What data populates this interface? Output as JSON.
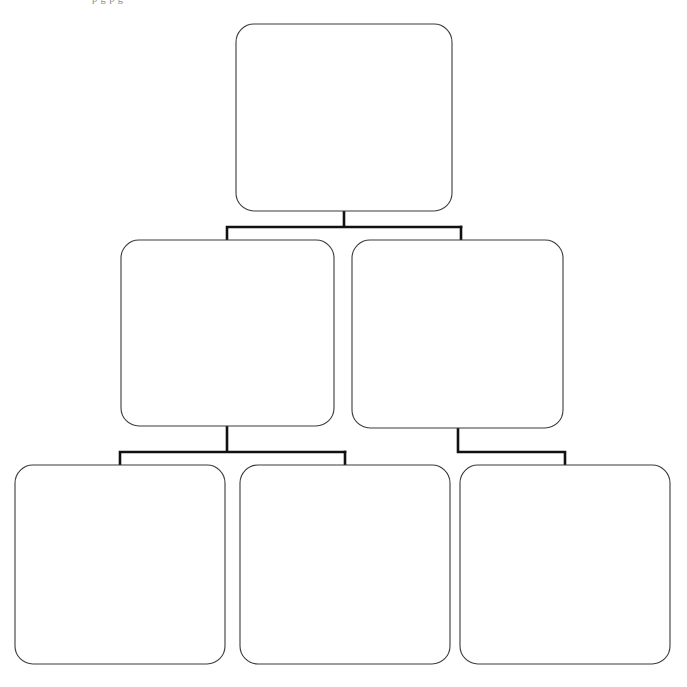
{
  "page": {
    "background_color": "#ffffff",
    "width": 687,
    "height": 687,
    "top_caption": "p g p g"
  },
  "style": {
    "node_fill": "#ffffff",
    "node_stroke": "#3b3b3b",
    "node_stroke_width": 1.1,
    "node_corner_radius": 18,
    "connector_stroke": "#111111",
    "connector_stroke_width": 2.6
  },
  "diagram": {
    "type": "hierarchy-tree",
    "orientation": "top-down",
    "levels": 3,
    "node_count": 6,
    "nodes": [
      {
        "id": "node-root",
        "level": 0,
        "label": "",
        "x": 236,
        "y": 24,
        "width": 216,
        "height": 187
      },
      {
        "id": "node-mid-left",
        "level": 1,
        "label": "",
        "x": 121,
        "y": 240,
        "width": 213,
        "height": 186
      },
      {
        "id": "node-mid-right",
        "level": 1,
        "label": "",
        "x": 352,
        "y": 240,
        "width": 211,
        "height": 188
      },
      {
        "id": "node-leaf-1",
        "level": 2,
        "label": "",
        "x": 15,
        "y": 465,
        "width": 210,
        "height": 199
      },
      {
        "id": "node-leaf-2",
        "level": 2,
        "label": "",
        "x": 240,
        "y": 465,
        "width": 210,
        "height": 199
      },
      {
        "id": "node-leaf-3",
        "level": 2,
        "label": "",
        "x": 460,
        "y": 465,
        "width": 210,
        "height": 199
      }
    ],
    "edges": [
      {
        "id": "edge-root-to-mid-left",
        "from": "node-root",
        "to": "node-mid-left",
        "path": "M344,211 L344,227 M227,227 L461,227 M227,227 L227,240"
      },
      {
        "id": "edge-root-to-mid-right",
        "from": "node-root",
        "to": "node-mid-right",
        "path": "M461,227 L461,240"
      },
      {
        "id": "edge-mid-left-to-leaf-1",
        "from": "node-mid-left",
        "to": "node-leaf-1",
        "path": "M227,426 L227,452 M120,452 L345,452 M120,452 L120,465"
      },
      {
        "id": "edge-mid-left-to-leaf-2",
        "from": "node-mid-left",
        "to": "node-leaf-2",
        "path": "M345,452 L345,465"
      },
      {
        "id": "edge-mid-right-to-leaf-3",
        "from": "node-mid-right",
        "to": "node-leaf-3",
        "path": "M458,428 L458,452 M458,452 L565,452 M565,452 L565,465"
      }
    ]
  }
}
